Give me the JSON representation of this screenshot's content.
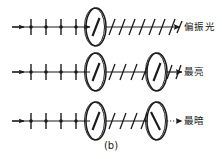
{
  "figure": {
    "caption": "(b)",
    "background_color": "#ffffff",
    "ink_color": "#1a1a1a",
    "width": 222,
    "height": 159,
    "type": "physics-optics-diagram"
  },
  "rows": [
    {
      "id": "row-1",
      "label": "偏振光",
      "axis_y": 27,
      "incoming_beam": {
        "kind": "unpolarized",
        "tick_orientation": "vertical",
        "tick_count": 4,
        "has_dots": true
      },
      "discs": [
        {
          "name": "polarizer",
          "cx": 96,
          "cy": 27,
          "axis_angle_deg": -25
        }
      ],
      "outgoing_beam": {
        "kind": "linearly-polarized",
        "tick_orientation": "diagonal",
        "tick_count": 8,
        "line_style": "solid",
        "arrowhead": true
      }
    },
    {
      "id": "row-2",
      "label": "最亮",
      "axis_y": 72,
      "incoming_beam": {
        "kind": "unpolarized",
        "tick_orientation": "vertical",
        "tick_count": 4,
        "has_dots": true
      },
      "discs": [
        {
          "name": "polarizer",
          "cx": 96,
          "cy": 72,
          "axis_angle_deg": -25
        },
        {
          "name": "analyzer",
          "cx": 157,
          "cy": 72,
          "axis_angle_deg": -25
        }
      ],
      "middle_beam": {
        "kind": "linearly-polarized",
        "tick_orientation": "diagonal",
        "tick_count": 4
      },
      "outgoing_beam": {
        "kind": "linearly-polarized",
        "tick_orientation": "diagonal",
        "tick_count": 2,
        "line_style": "solid",
        "arrowhead": true
      }
    },
    {
      "id": "row-3",
      "label": "最暗",
      "axis_y": 121,
      "incoming_beam": {
        "kind": "unpolarized",
        "tick_orientation": "vertical",
        "tick_count": 4,
        "has_dots": true
      },
      "discs": [
        {
          "name": "polarizer",
          "cx": 96,
          "cy": 121,
          "axis_angle_deg": -25
        },
        {
          "name": "analyzer",
          "cx": 157,
          "cy": 121,
          "axis_angle_deg": 30
        }
      ],
      "middle_beam": {
        "kind": "linearly-polarized",
        "tick_orientation": "diagonal",
        "tick_count": 4
      },
      "outgoing_beam": {
        "kind": "extinguished",
        "tick_orientation": "none",
        "tick_count": 0,
        "line_style": "dotted",
        "arrowhead": true
      }
    }
  ]
}
